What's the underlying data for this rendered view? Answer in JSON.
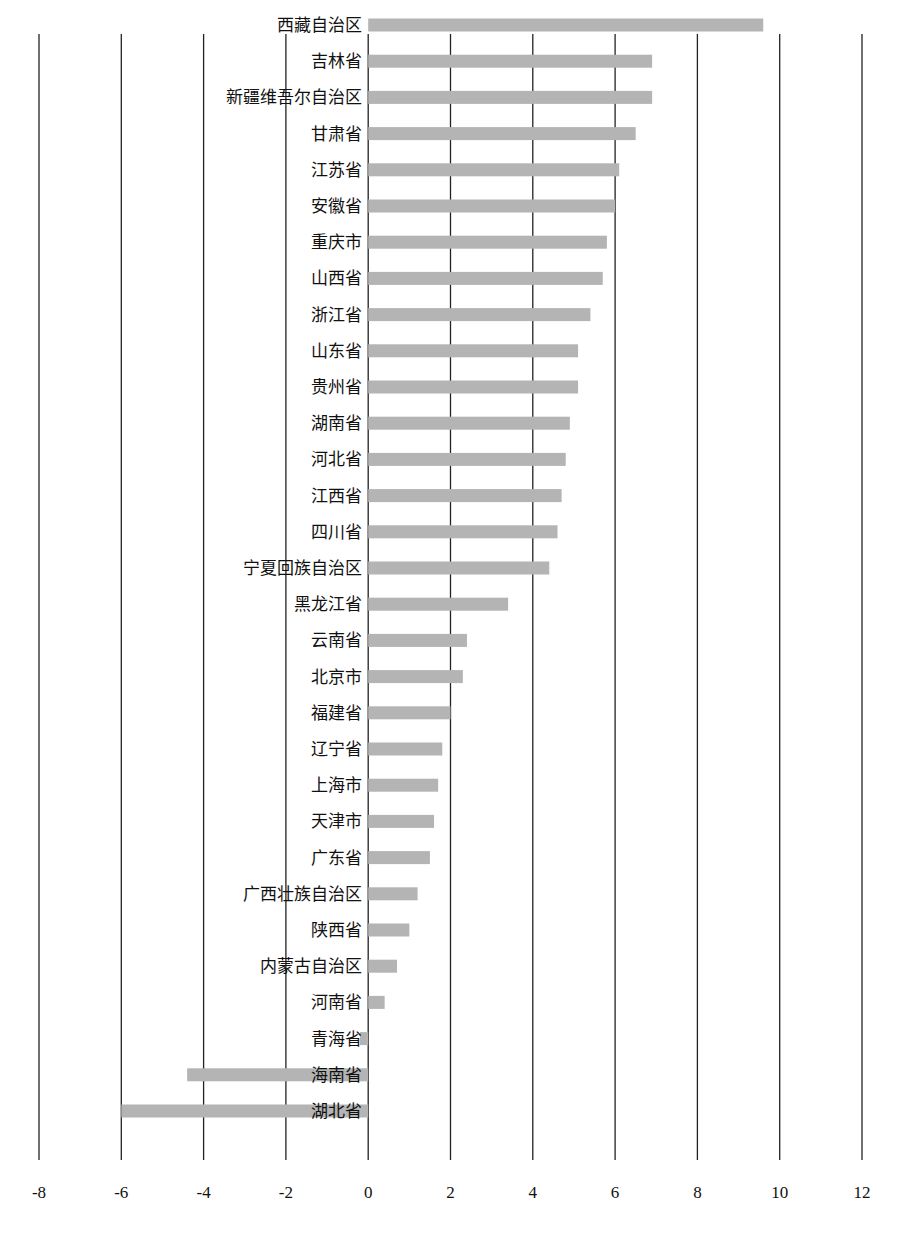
{
  "chart_data": {
    "type": "bar",
    "orientation": "horizontal",
    "title": "",
    "xlabel": "",
    "ylabel": "",
    "xlim": [
      -8,
      12
    ],
    "xticks": [
      -8,
      -6,
      -4,
      -2,
      0,
      2,
      4,
      6,
      8,
      10,
      12
    ],
    "grid": "vertical",
    "legend": "none",
    "bar_color": "#b4b4b4",
    "categories": [
      "西藏自治区",
      "吉林省",
      "新疆维吾尔自治区",
      "甘肃省",
      "江苏省",
      "安徽省",
      "重庆市",
      "山西省",
      "浙江省",
      "山东省",
      "贵州省",
      "湖南省",
      "河北省",
      "江西省",
      "四川省",
      "宁夏回族自治区",
      "黑龙江省",
      "云南省",
      "北京市",
      "福建省",
      "辽宁省",
      "上海市",
      "天津市",
      "广东省",
      "广西壮族自治区",
      "陕西省",
      "内蒙古自治区",
      "河南省",
      "青海省",
      "海南省",
      "湖北省"
    ],
    "values": [
      9.6,
      6.9,
      6.9,
      6.5,
      6.1,
      6.0,
      5.8,
      5.7,
      5.4,
      5.1,
      5.1,
      4.9,
      4.8,
      4.7,
      4.6,
      4.4,
      3.4,
      2.4,
      2.3,
      2.0,
      1.8,
      1.7,
      1.6,
      1.5,
      1.2,
      1.0,
      0.7,
      0.4,
      -0.2,
      -4.4,
      -6.0
    ]
  }
}
